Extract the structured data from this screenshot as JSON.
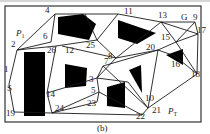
{
  "figure": {
    "caption": "(b)",
    "start_label": "S",
    "goal_label": "G",
    "p1_label": "P",
    "p1_sub": "1",
    "pt_label": "P",
    "pt_sub": "T"
  },
  "nodes": [
    {
      "id": "1",
      "x": 9,
      "y": 67,
      "lx": 4,
      "ly": 72
    },
    {
      "id": "2",
      "x": 17,
      "y": 49,
      "lx": 11,
      "ly": 47
    },
    {
      "id": "3",
      "x": 97,
      "y": 78,
      "lx": 89,
      "ly": 82
    },
    {
      "id": "4",
      "x": 55,
      "y": 14,
      "lx": 45,
      "ly": 13
    },
    {
      "id": "5",
      "x": 99,
      "y": 92,
      "lx": 91,
      "ly": 93
    },
    {
      "id": "6",
      "x": 51,
      "y": 42,
      "lx": 43,
      "ly": 39
    },
    {
      "id": "7",
      "x": 103,
      "y": 66,
      "lx": 104,
      "ly": 64
    },
    {
      "id": "8",
      "x": 116,
      "y": 58,
      "lx": 108,
      "ly": 59
    },
    {
      "id": "9",
      "x": 195,
      "y": 22,
      "lx": 193,
      "ly": 20
    },
    {
      "id": "10",
      "x": 147,
      "y": 96,
      "lx": 145,
      "ly": 101
    },
    {
      "id": "11",
      "x": 118,
      "y": 14,
      "lx": 124,
      "ly": 14
    },
    {
      "id": "12",
      "x": 62,
      "y": 46,
      "lx": 65,
      "ly": 53
    },
    {
      "id": "13",
      "x": 161,
      "y": 22,
      "lx": 158,
      "ly": 18
    },
    {
      "id": "14",
      "x": 47,
      "y": 93,
      "lx": 46,
      "ly": 97
    },
    {
      "id": "15",
      "x": 176,
      "y": 42,
      "lx": 161,
      "ly": 40
    },
    {
      "id": "16",
      "x": 175,
      "y": 56,
      "lx": 171,
      "ly": 67
    },
    {
      "id": "17",
      "x": 198,
      "y": 34,
      "lx": 197,
      "ly": 33
    },
    {
      "id": "18",
      "x": 197,
      "y": 74,
      "lx": 191,
      "ly": 77
    },
    {
      "id": "19",
      "x": 14,
      "y": 112,
      "lx": 6,
      "ly": 116
    },
    {
      "id": "20",
      "x": 158,
      "y": 50,
      "lx": 146,
      "ly": 50
    },
    {
      "id": "21",
      "x": 148,
      "y": 108,
      "lx": 152,
      "ly": 113
    },
    {
      "id": "22",
      "x": 142,
      "y": 115,
      "lx": 136,
      "ly": 119
    },
    {
      "id": "23",
      "x": 97,
      "y": 102,
      "lx": 87,
      "ly": 106
    },
    {
      "id": "24",
      "x": 52,
      "y": 113,
      "lx": 55,
      "ly": 111
    },
    {
      "id": "25",
      "x": 97,
      "y": 40,
      "lx": 86,
      "ly": 48
    },
    {
      "id": "26",
      "x": 56,
      "y": 46,
      "lx": 47,
      "ly": 53
    }
  ]
}
